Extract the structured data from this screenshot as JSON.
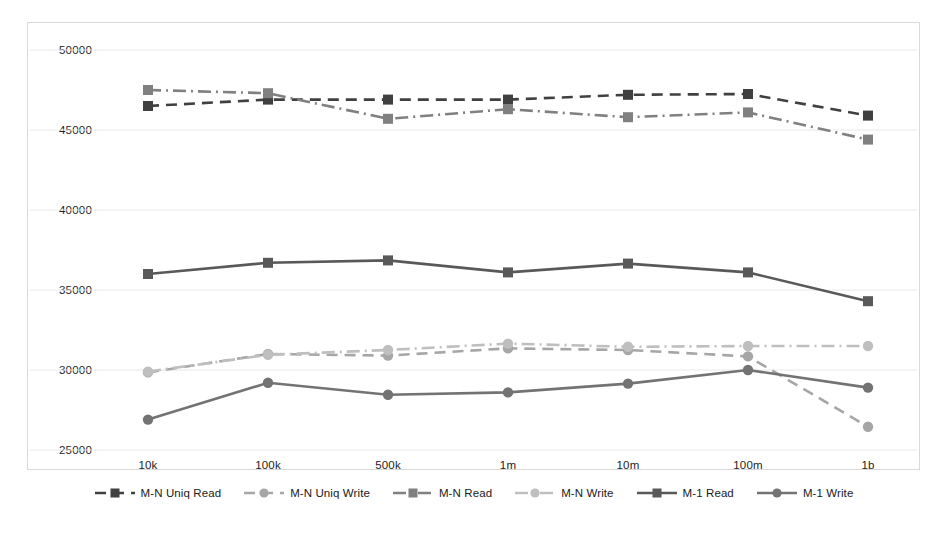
{
  "chart_data": {
    "type": "line",
    "title": "",
    "xlabel": "",
    "ylabel": "",
    "categories": [
      "10k",
      "100k",
      "500k",
      "1m",
      "10m",
      "100m",
      "1b"
    ],
    "ylim": [
      25000,
      50000
    ],
    "yticks": [
      25000,
      30000,
      35000,
      40000,
      45000,
      50000
    ],
    "ytick_labels": [
      "25000",
      "30000",
      "35000",
      "40000",
      "45000",
      "50000"
    ],
    "grid": true,
    "legend_position": "bottom",
    "series": [
      {
        "name": "M-N Uniq Read",
        "color": "#404040",
        "marker": "square",
        "dash": "dashed",
        "values": [
          46500,
          46900,
          46900,
          46900,
          47200,
          47250,
          45900
        ]
      },
      {
        "name": "M-N Uniq Write",
        "color": "#a6a6a6",
        "marker": "circle",
        "dash": "dashed",
        "values": [
          29850,
          31000,
          30900,
          31350,
          31250,
          30850,
          26450
        ]
      },
      {
        "name": "M-N Read",
        "color": "#808080",
        "marker": "square",
        "dash": "dashdot",
        "values": [
          47500,
          47300,
          45700,
          46300,
          45800,
          46100,
          44400
        ]
      },
      {
        "name": "M-N Write",
        "color": "#bfbfbf",
        "marker": "circle",
        "dash": "dashdot",
        "values": [
          29900,
          30950,
          31250,
          31650,
          31450,
          31500,
          31500
        ]
      },
      {
        "name": "M-1 Read",
        "color": "#595959",
        "marker": "square",
        "dash": "solid",
        "values": [
          36000,
          36700,
          36850,
          36100,
          36650,
          36100,
          34300
        ]
      },
      {
        "name": "M-1 Write",
        "color": "#737373",
        "marker": "circle",
        "dash": "solid",
        "values": [
          26900,
          29200,
          28450,
          28600,
          29150,
          30000,
          28900
        ]
      }
    ]
  },
  "axes": {
    "y_labels": [
      "50000",
      "45000",
      "40000",
      "35000",
      "30000",
      "25000"
    ],
    "x_labels": [
      "10k",
      "100k",
      "500k",
      "1m",
      "10m",
      "100m",
      "1b"
    ]
  },
  "legend": {
    "items": [
      {
        "label": "M-N Uniq Read"
      },
      {
        "label": "M-N Uniq Write"
      },
      {
        "label": "M-N Read"
      },
      {
        "label": "M-N Write"
      },
      {
        "label": "M-1 Read"
      },
      {
        "label": "M-1 Write"
      }
    ]
  },
  "colors": {
    "grid": "#e8e8e8",
    "frame": "#d9d9d9",
    "text": "#1a1a1a"
  }
}
